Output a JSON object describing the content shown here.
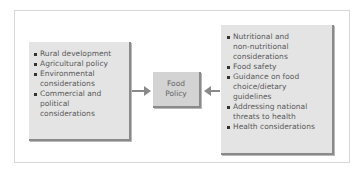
{
  "diagram": {
    "center": {
      "line1": "Food",
      "line2": "Policy"
    },
    "left_box": {
      "items": [
        {
          "lines": [
            "Rural development"
          ]
        },
        {
          "lines": [
            "Agricultural policy"
          ]
        },
        {
          "lines": [
            "Environmental",
            "considerations"
          ]
        },
        {
          "lines": [
            "Commercial and",
            "political",
            "considerations"
          ]
        }
      ]
    },
    "right_box": {
      "items": [
        {
          "lines": [
            "Nutritional and",
            "non-nutritional",
            "considerations"
          ]
        },
        {
          "lines": [
            "Food safety"
          ]
        },
        {
          "lines": [
            "Guidance on food",
            "choice/dietary",
            "guidelines"
          ]
        },
        {
          "lines": [
            "Addressing national",
            "threats to health"
          ]
        },
        {
          "lines": [
            "Health considerations"
          ]
        }
      ]
    },
    "colors": {
      "box_fill": "#e4e4e4",
      "center_fill": "#d3d3d3",
      "shadow": "#8a8a8a",
      "arrow": "#8a8a8a",
      "text": "#5a5a5a",
      "frame_border": "#d8d8d8"
    }
  }
}
